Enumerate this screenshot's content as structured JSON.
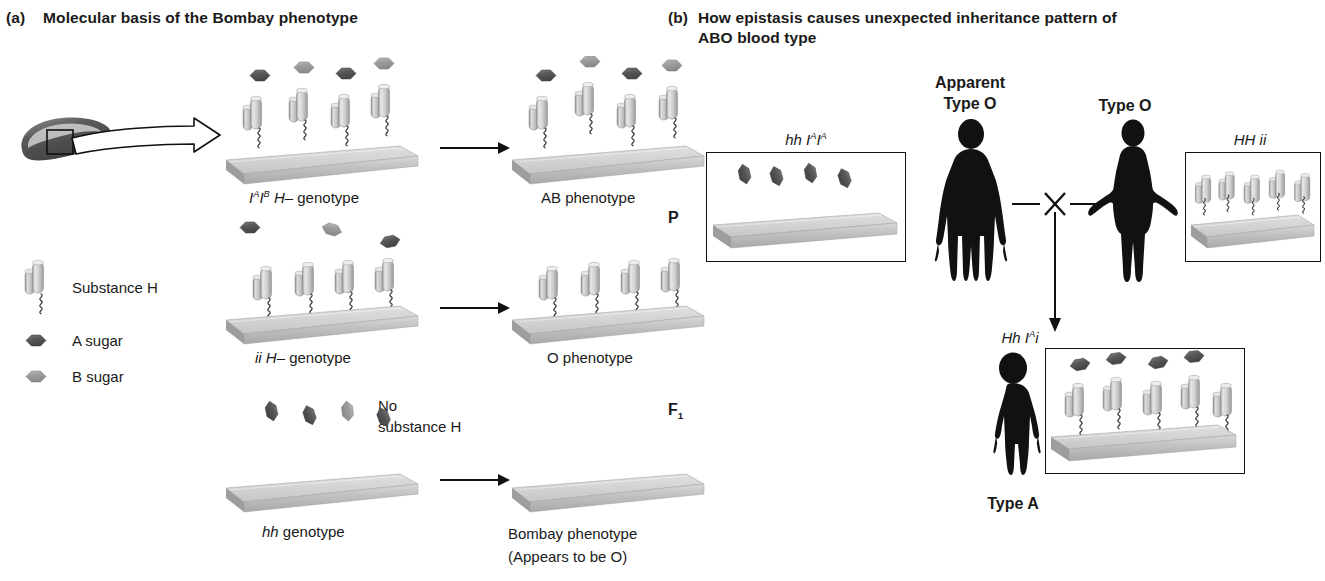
{
  "figure": {
    "panel_a": {
      "tag": "(a)",
      "title": "Molecular basis of the Bombay phenotype",
      "legend": {
        "items": [
          {
            "icon": "cylinder-pair-icon",
            "label": "Substance H"
          },
          {
            "icon": "dark-hexagon-icon",
            "label": "A sugar"
          },
          {
            "icon": "light-hexagon-icon",
            "label": "B sugar"
          }
        ]
      },
      "cell_callout": {
        "icon": "red-blood-cell-icon",
        "zoom_box": "membrane-detail-box",
        "arrow": "block-arrow-right-icon"
      },
      "rows": [
        {
          "genotype_label": {
            "prefix_italic": "I",
            "sup1": "A",
            "mid_italic": "I",
            "sup2": "B",
            "suffix_italic": " H–",
            "plain": " genotype",
            "full": "IᴬIᴮ H– genotype"
          },
          "phenotype_label": "AB phenotype",
          "left_surface": {
            "substance_h_count": 4,
            "a_sugar_count": 2,
            "b_sugar_count": 2,
            "free_sugars": 0
          },
          "right_surface": {
            "substance_h_count": 4,
            "a_sugar_count": 2,
            "b_sugar_count": 2,
            "attached": true
          },
          "arrow": "arrow-right-icon"
        },
        {
          "genotype_label": {
            "full": "ii H– genotype",
            "italic_part": "ii H–",
            "plain": " genotype"
          },
          "phenotype_label": "O phenotype",
          "left_surface": {
            "substance_h_count": 4,
            "free_sugars": 3
          },
          "right_surface": {
            "substance_h_count": 4,
            "sugars": 0
          },
          "arrow": "arrow-right-icon"
        },
        {
          "genotype_label": {
            "full": "hh genotype",
            "italic_part": "hh",
            "plain": " genotype"
          },
          "phenotype_label": "Bombay phenotype",
          "phenotype_sublabel": "(Appears to be O)",
          "note": "No\nsubstance H",
          "note_line1": "No",
          "note_line2": "substance H",
          "left_surface": {
            "substance_h_count": 0,
            "free_sugars": 4
          },
          "right_surface": {
            "substance_h_count": 0,
            "sugars": 0
          },
          "arrow": "arrow-right-icon"
        }
      ]
    },
    "panel_b": {
      "tag": "(b)",
      "title_line1": "How epistasis causes unexpected inheritance pattern of",
      "title_line2": "ABO blood type",
      "generation_labels": [
        {
          "name": "P",
          "text": "P"
        },
        {
          "name": "F1",
          "text": "F",
          "sub": "1"
        }
      ],
      "parents": [
        {
          "side": "left",
          "phenotype_line1": "Apparent",
          "phenotype_line2": "Type O",
          "genotype": "hh IᴬIᴬ",
          "genotype_parts": {
            "p1": "hh I",
            "sup1": "A",
            "p2": "I",
            "sup2": "A"
          },
          "silhouette": "male-silhouette-icon",
          "surface": {
            "substance_h_count": 0,
            "free_a_sugars": 4
          }
        },
        {
          "side": "right",
          "phenotype_line1": "",
          "phenotype_line2": "Type O",
          "genotype": "HH ii",
          "silhouette": "female-silhouette-icon",
          "surface": {
            "substance_h_count": 5,
            "sugars": 0
          }
        }
      ],
      "cross_symbol": "cross-icon",
      "descent_arrow": "arrow-down-icon",
      "offspring": {
        "genotype": "Hh Iᴬi",
        "genotype_parts": {
          "p1": "Hh I",
          "sup1": "A",
          "p2": "i"
        },
        "silhouette": "child-silhouette-icon",
        "phenotype": "Type A",
        "surface": {
          "substance_h_count": 5,
          "a_sugar_count": 4
        }
      }
    }
  },
  "colors": {
    "ink": "#1a1a1a",
    "membrane_light": "#cfcfcf",
    "membrane_mid": "#b4b4b4",
    "membrane_dark": "#9a9a9a",
    "cylinder_light": "#e3e3e3",
    "cylinder_mid": "#bcbcbc",
    "a_sugar": "#5c5c5c",
    "b_sugar": "#a0a0a0",
    "silhouette": "#111111"
  }
}
